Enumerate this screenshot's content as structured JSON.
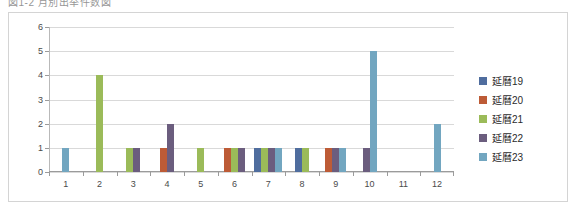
{
  "caption": "図1-2  月別出举件数図",
  "chart_data": {
    "type": "bar",
    "title": "",
    "xlabel": "",
    "ylabel": "",
    "categories": [
      "1",
      "2",
      "3",
      "4",
      "5",
      "6",
      "7",
      "8",
      "9",
      "10",
      "11",
      "12"
    ],
    "ylim": [
      0,
      6
    ],
    "yticks": [
      0,
      1,
      2,
      3,
      4,
      5,
      6
    ],
    "grid": true,
    "legend_position": "right",
    "series": [
      {
        "name": "延曆19",
        "color": "#4f6d9e",
        "values": [
          0,
          0,
          0,
          0,
          0,
          0,
          1,
          1,
          0,
          0,
          0,
          0
        ]
      },
      {
        "name": "延曆20",
        "color": "#bd5b36",
        "values": [
          0,
          0,
          0,
          1,
          0,
          1,
          0,
          0,
          1,
          0,
          0,
          0
        ]
      },
      {
        "name": "延曆21",
        "color": "#9bbb59",
        "values": [
          0,
          4,
          1,
          0,
          1,
          1,
          1,
          1,
          0,
          0,
          0,
          0
        ]
      },
      {
        "name": "延曆22",
        "color": "#6b5d7e",
        "values": [
          0,
          0,
          1,
          2,
          0,
          1,
          1,
          0,
          1,
          1,
          0,
          0
        ]
      },
      {
        "name": "延曆23",
        "color": "#72a6c0",
        "values": [
          1,
          0,
          0,
          0,
          0,
          0,
          1,
          0,
          1,
          5,
          0,
          2
        ]
      }
    ]
  }
}
